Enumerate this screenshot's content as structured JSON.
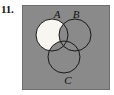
{
  "figure": {
    "item_number": "11.",
    "type": "venn-diagram",
    "set_count": 3,
    "panel": {
      "background_color": "#8a8a8a",
      "border_color": "#6e6e6e",
      "x": 22,
      "y": 5,
      "width": 88,
      "height": 85
    },
    "style": {
      "circle_stroke_color": "#1a1a1a",
      "circle_stroke_width": 1,
      "shaded_fill_color": "#f7f6f1",
      "unshaded_fill_color": "none",
      "label_color": "#101010"
    },
    "circles": [
      {
        "id": "A",
        "label": "A",
        "cx": 30,
        "cy": 30,
        "r": 16,
        "label_x": 35,
        "label_y": 13
      },
      {
        "id": "B",
        "label": "B",
        "cx": 53,
        "cy": 30,
        "r": 16,
        "label_x": 54,
        "label_y": 13
      },
      {
        "id": "C",
        "label": "C",
        "cx": 42,
        "cy": 52,
        "r": 16,
        "label_x": 46,
        "label_y": 79
      }
    ],
    "shaded_region": {
      "description": "A minus (B union C)",
      "set_expression": "A - (B ∪ C)",
      "shaded_sets": [
        "A"
      ],
      "excluded_sets": [
        "B",
        "C"
      ]
    }
  }
}
